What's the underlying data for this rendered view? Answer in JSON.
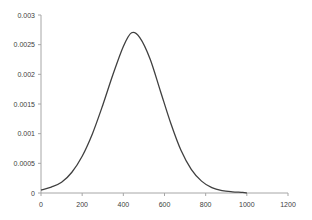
{
  "chart_data": {
    "type": "line",
    "title": "",
    "xlabel": "",
    "ylabel": "",
    "xlim": [
      0,
      1200
    ],
    "ylim": [
      0,
      0.003
    ],
    "grid": false,
    "legend": null,
    "x_ticks": [
      "0",
      "200",
      "400",
      "600",
      "800",
      "1000",
      "1200"
    ],
    "y_ticks": [
      "0",
      "0.0005",
      "0.001",
      "0.0015",
      "0.002",
      "0.0025",
      "0.003"
    ],
    "series": [
      {
        "name": "density",
        "color": "#404040",
        "x": [
          0,
          50,
          100,
          150,
          200,
          250,
          300,
          350,
          400,
          440,
          480,
          530,
          580,
          630,
          680,
          730,
          780,
          830,
          880,
          930,
          980,
          1000
        ],
        "values": [
          5e-05,
          0.0001,
          0.00018,
          0.00035,
          0.00062,
          0.001,
          0.00148,
          0.002,
          0.00247,
          0.0027,
          0.00262,
          0.00226,
          0.00172,
          0.00118,
          0.00072,
          0.0004,
          0.0002,
          9e-05,
          4e-05,
          2e-05,
          1e-05,
          0.0
        ]
      }
    ]
  }
}
